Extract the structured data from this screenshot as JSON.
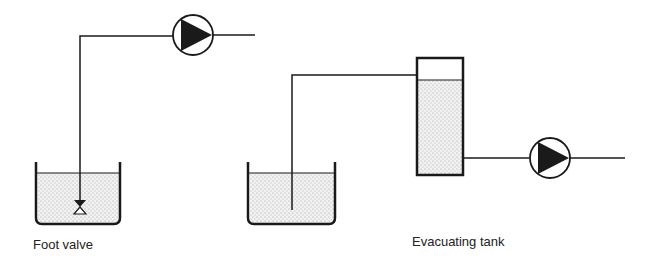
{
  "labels": {
    "left": "Foot valve",
    "right": "Evacuating tank"
  },
  "colors": {
    "line": "#1a1a1a",
    "liquid_dots": "#9a9a9a"
  },
  "components": {
    "left": [
      "tank",
      "suction-pipe",
      "foot-valve",
      "pump"
    ],
    "right": [
      "tank",
      "suction-pipe",
      "evacuating-tank",
      "pump"
    ]
  }
}
